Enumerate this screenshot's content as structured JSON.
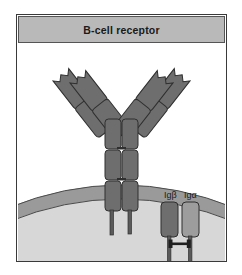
{
  "figure": {
    "title": "B-cell receptor",
    "domain_type": "biology-diagram",
    "caption_band_color": "#b9b9b9",
    "frame_border_color": "#3a3a3a",
    "background_color": "#ffffff"
  },
  "labels": {
    "ig_beta": "Igβ",
    "ig_alpha": "Igα"
  },
  "colors": {
    "protein_dark": "#6e6e6e",
    "protein_mid": "#7a7a7a",
    "protein_light": "#9d9d9d",
    "protein_outline": "#2f2f2f",
    "membrane_band": "#9a9a9a",
    "membrane_outline": "#4a4a4a",
    "cytoplasm": "#d7d7d7",
    "extracellular": "#ffffff",
    "tail_color": "#5a5a5a",
    "text_color": "#1a1a1a"
  },
  "structures": {
    "antibody": {
      "name": "membrane-bound immunoglobulin",
      "arm_count": 2,
      "light_chain_domains": 2,
      "heavy_chain_stem_domains": 3,
      "variable_domain_notch": true,
      "transmembrane_tails": 2
    },
    "ig_beta_subunit": {
      "shade": "dark",
      "tail_extends_to_cytoplasm": true
    },
    "ig_alpha_subunit": {
      "shade": "light",
      "tail_extends_to_cytoplasm": true
    },
    "disulfide_bond": {
      "present": true,
      "connects": "Igβ and Igα tails"
    },
    "membrane": {
      "shape": "curved band",
      "curvature": "convex upward"
    }
  }
}
